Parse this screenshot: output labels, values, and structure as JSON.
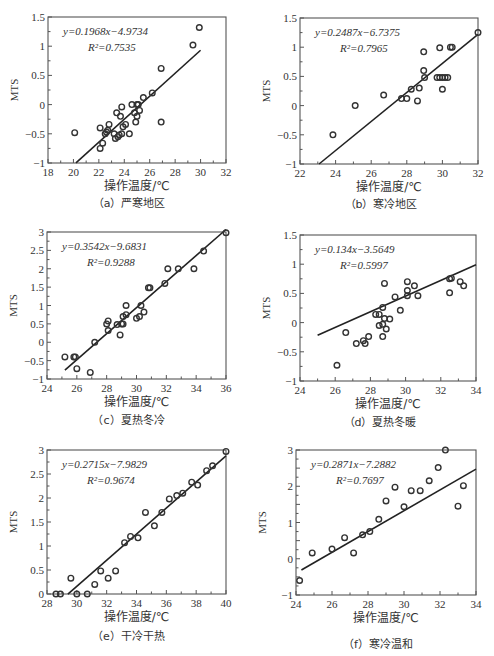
{
  "figure": {
    "panels": [
      {
        "id": "a",
        "caption": "（a）严寒地区"
      },
      {
        "id": "b",
        "caption": "（b）寒冷地区"
      },
      {
        "id": "c",
        "caption": "（c）夏热冬冷"
      },
      {
        "id": "d",
        "caption": "（d）夏热冬暖"
      },
      {
        "id": "e",
        "caption": "（e）干冷干热"
      },
      {
        "id": "f",
        "caption": "（f）寒冷温和"
      }
    ]
  },
  "chart_data": [
    {
      "type": "scatter",
      "title": "（a）严寒地区",
      "xlabel": "操作温度/℃",
      "ylabel": "MTS",
      "xlim": [
        18,
        32
      ],
      "ylim": [
        -1,
        1.5
      ],
      "xticks": [
        18,
        20,
        22,
        24,
        26,
        28,
        30,
        32
      ],
      "yticks": [
        -1,
        -0.5,
        0,
        0.5,
        1,
        1.5
      ],
      "ytick_labels": [
        "-1",
        "-0.5",
        "0",
        "0.5",
        "1",
        "1.5"
      ],
      "equation": "y=0.1968x−4.9734",
      "r2": "R²=0.7535",
      "fit": {
        "slope": 0.1968,
        "intercept": -4.9734,
        "x_range": [
          20.2,
          30
        ]
      },
      "points": [
        [
          20.1,
          -0.48
        ],
        [
          22.1,
          -0.4
        ],
        [
          22.1,
          -0.75
        ],
        [
          22.3,
          -0.66
        ],
        [
          22.5,
          -0.5
        ],
        [
          22.6,
          -0.47
        ],
        [
          22.7,
          -0.44
        ],
        [
          22.8,
          -0.34
        ],
        [
          23.2,
          -0.5
        ],
        [
          23.3,
          -0.58
        ],
        [
          23.4,
          -0.14
        ],
        [
          23.5,
          -0.55
        ],
        [
          23.6,
          -0.52
        ],
        [
          23.7,
          -0.2
        ],
        [
          23.8,
          -0.04
        ],
        [
          23.9,
          -0.38
        ],
        [
          23.8,
          -0.5
        ],
        [
          24.1,
          -0.34
        ],
        [
          24.4,
          -0.5
        ],
        [
          24.6,
          0
        ],
        [
          24.8,
          -0.14
        ],
        [
          24.9,
          -0.3
        ],
        [
          25.0,
          -0.2
        ],
        [
          25.0,
          0
        ],
        [
          25.1,
          0
        ],
        [
          25.2,
          -0.1
        ],
        [
          25.5,
          0.12
        ],
        [
          26.2,
          0.2
        ],
        [
          26.9,
          0.62
        ],
        [
          26.9,
          -0.3
        ],
        [
          29.4,
          1.02
        ],
        [
          29.9,
          1.32
        ]
      ]
    },
    {
      "type": "scatter",
      "title": "（b）寒冷地区",
      "xlabel": "操作温度/℃",
      "ylabel": "MTS",
      "xlim": [
        22,
        32
      ],
      "ylim": [
        -1,
        1.5
      ],
      "xticks": [
        22,
        24,
        26,
        28,
        30,
        32
      ],
      "yticks": [
        -1,
        -0.5,
        0,
        0.5,
        1,
        1.5
      ],
      "ytick_labels": [
        "-1",
        "-0.5",
        "0",
        "0.5",
        "1",
        "1.5"
      ],
      "equation": "y=0.2487x−6.7375",
      "r2": "R²=0.7965",
      "fit": {
        "slope": 0.2487,
        "intercept": -6.7375,
        "x_range": [
          23.07,
          32
        ]
      },
      "points": [
        [
          23.85,
          -0.5
        ],
        [
          25.1,
          0
        ],
        [
          26.7,
          0.18
        ],
        [
          27.7,
          0.12
        ],
        [
          28.0,
          0.12
        ],
        [
          28.25,
          0.28
        ],
        [
          28.6,
          0.08
        ],
        [
          28.7,
          0.3
        ],
        [
          28.95,
          0.6
        ],
        [
          28.95,
          0.92
        ],
        [
          29.0,
          0.48
        ],
        [
          29.7,
          0.48
        ],
        [
          29.85,
          0.48
        ],
        [
          29.85,
          0.99
        ],
        [
          30.0,
          0.48
        ],
        [
          30.0,
          0.28
        ],
        [
          30.15,
          0.48
        ],
        [
          30.3,
          0.48
        ],
        [
          30.45,
          1.0
        ],
        [
          30.55,
          1.0
        ],
        [
          32.0,
          1.25
        ]
      ]
    },
    {
      "type": "scatter",
      "title": "（c）夏热冬冷",
      "xlabel": "操作温度/℃",
      "ylabel": "MTS",
      "xlim": [
        24,
        36
      ],
      "ylim": [
        -1,
        3
      ],
      "xticks": [
        24,
        26,
        28,
        30,
        32,
        34,
        36
      ],
      "yticks": [
        -1,
        -0.5,
        0,
        0.5,
        1,
        1.5,
        2,
        2.5,
        3
      ],
      "ytick_labels": [
        "-1",
        "-0.5",
        "0",
        "0.5",
        "1",
        "1.5",
        "2",
        "2.5",
        "3"
      ],
      "equation": "y=0.3542x−9.6831",
      "r2": "R²=0.9288",
      "fit": {
        "slope": 0.3542,
        "intercept": -9.6831,
        "x_range": [
          25.2,
          36
        ]
      },
      "points": [
        [
          25.2,
          -0.4
        ],
        [
          25.8,
          -0.4
        ],
        [
          25.9,
          -0.4
        ],
        [
          26.0,
          -0.72
        ],
        [
          26.9,
          -0.82
        ],
        [
          27.2,
          0
        ],
        [
          28.0,
          0.5
        ],
        [
          28.1,
          0.58
        ],
        [
          28.1,
          0.32
        ],
        [
          28.7,
          0.48
        ],
        [
          28.9,
          0.2
        ],
        [
          29.0,
          0.5
        ],
        [
          29.1,
          0.5
        ],
        [
          29.1,
          0.7
        ],
        [
          29.3,
          0.75
        ],
        [
          29.3,
          1.0
        ],
        [
          30.0,
          0.65
        ],
        [
          30.2,
          0.7
        ],
        [
          30.3,
          1.0
        ],
        [
          30.5,
          0.82
        ],
        [
          30.8,
          1.48
        ],
        [
          30.9,
          1.48
        ],
        [
          31.9,
          1.6
        ],
        [
          32.1,
          2.0
        ],
        [
          32.8,
          2.0
        ],
        [
          33.85,
          2.0
        ],
        [
          34.5,
          2.48
        ],
        [
          36.0,
          2.98
        ]
      ]
    },
    {
      "type": "scatter",
      "title": "（d）夏热冬暖",
      "xlabel": "操作温度/℃",
      "ylabel": "MTS",
      "xlim": [
        24,
        34
      ],
      "ylim": [
        -1,
        1.5
      ],
      "xticks": [
        24,
        26,
        28,
        30,
        32,
        34
      ],
      "yticks": [
        -1,
        -0.5,
        0,
        0.5,
        1,
        1.5
      ],
      "ytick_labels": [
        "-1",
        "-0.5",
        "0",
        "0.5",
        "1",
        "1.5"
      ],
      "equation": "y=0.134x−3.5649",
      "r2": "R²=0.5997",
      "fit": {
        "slope": 0.134,
        "intercept": -3.5649,
        "x_range": [
          25,
          34
        ]
      },
      "points": [
        [
          26.1,
          -0.73
        ],
        [
          26.6,
          -0.17
        ],
        [
          27.2,
          -0.36
        ],
        [
          27.6,
          -0.31
        ],
        [
          27.7,
          -0.36
        ],
        [
          27.9,
          -0.24
        ],
        [
          28.3,
          0.14
        ],
        [
          28.5,
          0.14
        ],
        [
          28.5,
          -0.05
        ],
        [
          28.7,
          -0.03
        ],
        [
          28.7,
          0.26
        ],
        [
          28.7,
          -0.24
        ],
        [
          28.8,
          0.67
        ],
        [
          28.8,
          0.07
        ],
        [
          28.9,
          -0.11
        ],
        [
          29.1,
          0.06
        ],
        [
          29.4,
          0.44
        ],
        [
          29.7,
          0.21
        ],
        [
          30.1,
          0.7
        ],
        [
          30.1,
          0.55
        ],
        [
          30.1,
          0.46
        ],
        [
          30.5,
          0.63
        ],
        [
          30.7,
          0.46
        ],
        [
          32.5,
          0.75
        ],
        [
          32.5,
          0.51
        ],
        [
          32.6,
          0.76
        ],
        [
          33.1,
          0.7
        ],
        [
          33.3,
          0.63
        ]
      ]
    },
    {
      "type": "scatter",
      "title": "（e）干冷干热",
      "xlabel": "操作温度/℃",
      "ylabel": "MTS",
      "xlim": [
        28,
        40
      ],
      "ylim": [
        0,
        3
      ],
      "xticks": [
        28,
        30,
        32,
        34,
        36,
        38,
        40
      ],
      "yticks": [
        0,
        0.5,
        1,
        1.5,
        2,
        2.5,
        3
      ],
      "ytick_labels": [
        "0",
        "0.5",
        "1",
        "1.5",
        "2",
        "2.5",
        "3"
      ],
      "equation": "y=0.2715x−7.9829",
      "r2": "R²=0.9674",
      "fit": {
        "slope": 0.2715,
        "intercept": -7.9829,
        "x_range": [
          29.4,
          40
        ]
      },
      "points": [
        [
          28.6,
          0
        ],
        [
          28.9,
          0
        ],
        [
          29.6,
          0.33
        ],
        [
          30.0,
          0
        ],
        [
          30.7,
          0
        ],
        [
          31.2,
          0.2
        ],
        [
          31.6,
          0.48
        ],
        [
          32.1,
          0.33
        ],
        [
          32.6,
          0.48
        ],
        [
          33.2,
          1.07
        ],
        [
          33.6,
          1.2
        ],
        [
          34.1,
          1.17
        ],
        [
          34.6,
          1.7
        ],
        [
          35.2,
          1.42
        ],
        [
          35.7,
          1.7
        ],
        [
          36.2,
          1.98
        ],
        [
          36.7,
          2.05
        ],
        [
          37.1,
          2.1
        ],
        [
          37.7,
          2.33
        ],
        [
          38.1,
          2.27
        ],
        [
          38.7,
          2.57
        ],
        [
          39.1,
          2.67
        ],
        [
          40.0,
          2.97
        ]
      ]
    },
    {
      "type": "scatter",
      "title": "（f）寒冷温和",
      "xlabel": "操作温度/℃",
      "ylabel": "MTS",
      "xlim": [
        24,
        34
      ],
      "ylim": [
        -1,
        3
      ],
      "xticks": [
        24,
        26,
        28,
        30,
        32,
        34
      ],
      "yticks": [
        -1,
        -0.5,
        0,
        0.5,
        1,
        1.5,
        2,
        2.5,
        3
      ],
      "ytick_labels": [
        "-1",
        "",
        "0",
        "",
        "1",
        "",
        "2",
        "",
        "3"
      ],
      "equation": "y=0.2871x−7.2882",
      "r2": "R²=0.7697",
      "fit": {
        "slope": 0.2871,
        "intercept": -7.2882,
        "x_range": [
          24.3,
          34
        ]
      },
      "points": [
        [
          24.2,
          -0.6
        ],
        [
          24.9,
          0.2
        ],
        [
          26.0,
          0.33
        ],
        [
          26.7,
          0.72
        ],
        [
          27.2,
          0.2
        ],
        [
          27.7,
          0.82
        ],
        [
          28.1,
          0.93
        ],
        [
          28.6,
          1.35
        ],
        [
          29.0,
          1.98
        ],
        [
          29.5,
          2.45
        ],
        [
          30.0,
          1.78
        ],
        [
          30.4,
          2.33
        ],
        [
          30.9,
          2.33
        ],
        [
          31.4,
          2.67
        ],
        [
          31.9,
          3.12
        ],
        [
          32.3,
          3.72
        ],
        [
          33.0,
          1.8
        ],
        [
          33.3,
          2.5
        ]
      ]
    }
  ]
}
